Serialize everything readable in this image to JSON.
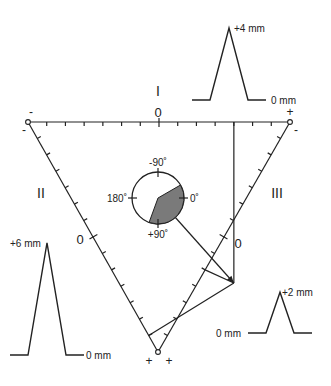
{
  "diagram": {
    "leads": [
      {
        "name": "I",
        "label": "I",
        "zero_label": "0",
        "neg_label": "-",
        "pos_label": "+",
        "qrs_amplitude_mm": 4,
        "peak_label": "+4 mm",
        "baseline_label": "0 mm"
      },
      {
        "name": "II",
        "label": "II",
        "zero_label": "0",
        "neg_label": "-",
        "pos_label": "+",
        "qrs_amplitude_mm": 6,
        "peak_label": "+6 mm",
        "baseline_label": "0 mm"
      },
      {
        "name": "III",
        "label": "III",
        "zero_label": "0",
        "neg_label": "-",
        "pos_label": "+",
        "qrs_amplitude_mm": 2,
        "peak_label": "+2 mm",
        "baseline_label": "0 mm"
      }
    ],
    "ticks_per_half_axis": 7,
    "axis_circle": {
      "labels": {
        "top": "-90˚",
        "left": "180˚",
        "right": "0˚",
        "bottom": "+90˚"
      },
      "normal_range_deg": [
        -30,
        110
      ],
      "mean_axis_deg": 49,
      "sector_color": "#7a7a7a"
    },
    "colors": {
      "ink": "#222222",
      "background": "#ffffff"
    }
  }
}
